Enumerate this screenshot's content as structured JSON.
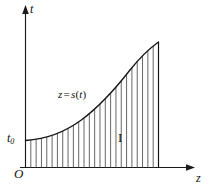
{
  "figure": {
    "title_label": "",
    "axes": {
      "vertical_label": "t",
      "horizontal_label": "z",
      "origin_label": "O",
      "initial_value_label": "t",
      "initial_value_subscript": "0"
    },
    "curve": {
      "label_variable": "z",
      "label_equals": "=",
      "label_function": "s",
      "label_open_paren": "(",
      "label_argument": "t",
      "label_close_paren": ")"
    },
    "region": {
      "label": "I"
    },
    "colors": {
      "axis": "#1a1a1a",
      "curve": "#141414",
      "hatch": "#4a4a4a",
      "background": "#ffffff",
      "text": "#111111"
    }
  },
  "chart_data": {
    "type": "area",
    "title": "",
    "xlabel": "z",
    "ylabel": "t",
    "grid": false,
    "legend": "none",
    "annotations": [
      {
        "text": "z = s(t)",
        "x": 0.42,
        "y": 0.62
      },
      {
        "text": "I",
        "x": 0.72,
        "y": 0.27
      },
      {
        "text": "t0",
        "x": 0.0,
        "y": 0.22
      },
      {
        "text": "O",
        "x": 0.0,
        "y": 0.0
      }
    ],
    "xlim": [
      0,
      10
    ],
    "ylim": [
      0,
      10
    ],
    "series": [
      {
        "name": "z = s(t)",
        "x": [
          0.0,
          0.5,
          1.0,
          1.5,
          2.0,
          2.5,
          3.0,
          3.5,
          4.0,
          4.5,
          5.0,
          5.5,
          6.0,
          6.5,
          7.0,
          7.5,
          8.0,
          8.5,
          9.0,
          9.5,
          10.0
        ],
        "y": [
          1.85,
          1.92,
          2.05,
          2.22,
          2.45,
          2.72,
          3.05,
          3.42,
          3.85,
          4.32,
          4.85,
          5.42,
          6.05,
          6.72,
          7.45,
          8.22,
          9.05,
          9.95,
          10.9,
          11.9,
          12.95
        ]
      }
    ],
    "hatch_count": 25,
    "hatch_orientation": "vertical",
    "fill_description": "region between curve and horizontal axis filled with vertical hatch lines"
  }
}
